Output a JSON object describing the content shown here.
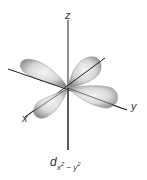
{
  "diagram": {
    "axes": {
      "z_label": "z",
      "x_label": "x",
      "y_label": "y"
    },
    "orbital_label": {
      "main": "d",
      "sub_x": "x",
      "sup_x": "2",
      "minus": " − ",
      "sub_y": "y",
      "sup_y": "2"
    },
    "colors": {
      "lobe_light": "#f2f2f2",
      "lobe_dark": "#8c8c8c",
      "axis": "#222222"
    }
  }
}
